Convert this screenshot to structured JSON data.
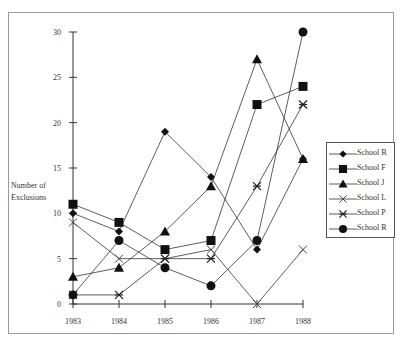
{
  "chart_data": {
    "type": "line",
    "title": "",
    "xlabel": "",
    "ylabel": "Number of Exclusions",
    "ylabel_lines": [
      "Number of",
      "Exclusions"
    ],
    "categories": [
      "1983",
      "1984",
      "1985",
      "1986",
      "1987",
      "1988"
    ],
    "x_tick_labels": [
      "1983",
      "1984",
      "1985",
      "1986",
      "1987",
      "1988"
    ],
    "y_ticks": [
      0,
      5,
      10,
      15,
      20,
      25,
      30
    ],
    "ylim": [
      0,
      30
    ],
    "grid": false,
    "legend_position": "right",
    "series": [
      {
        "name": "School B",
        "marker": "diamond",
        "values": [
          10,
          8,
          19,
          14,
          6,
          16
        ]
      },
      {
        "name": "School F",
        "marker": "square",
        "values": [
          11,
          9,
          6,
          7,
          22,
          24
        ]
      },
      {
        "name": "School J",
        "marker": "triangle",
        "values": [
          3,
          4,
          8,
          13,
          27,
          16
        ]
      },
      {
        "name": "School L",
        "marker": "x",
        "values": [
          9,
          5,
          5,
          6,
          0,
          6
        ]
      },
      {
        "name": "School P",
        "marker": "asterisk",
        "values": [
          1,
          1,
          5,
          5,
          13,
          22
        ]
      },
      {
        "name": "School R",
        "marker": "circle",
        "values": [
          1,
          7,
          4,
          2,
          7,
          30
        ]
      }
    ]
  },
  "legend": {
    "items": [
      "School B",
      "School F",
      "School J",
      "School L",
      "School P",
      "School R"
    ]
  },
  "axis": {
    "ylabel_line1": "Number of",
    "ylabel_line2": "Exclusions"
  },
  "colors": {
    "line": "#333333",
    "marker": "#111111",
    "frame": "#9a9a9a"
  }
}
